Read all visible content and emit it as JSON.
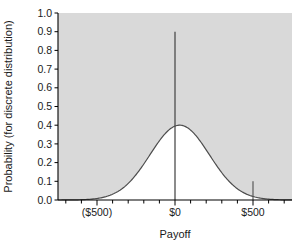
{
  "chart_data": {
    "type": "line",
    "title": "",
    "subtitle": "",
    "xlabel": "Payoff",
    "ylabel": "Probability (for discrete distribution)",
    "xlim": [
      -750,
      750
    ],
    "ylim": [
      0.0,
      1.0
    ],
    "grid": false,
    "legend": null,
    "plot_background": "#d9d9d9",
    "line_color": "#4d4d4d",
    "fill_color": "#ffffff",
    "axis_color": "#000000",
    "x_tick_labels": [
      "($500)",
      "$0",
      "$500"
    ],
    "x_tick_values": [
      -500,
      0,
      500
    ],
    "x_minor_tick_step": 100,
    "y_tick_labels": [
      "0.0",
      "0.1",
      "0.2",
      "0.3",
      "0.4",
      "0.5",
      "0.6",
      "0.7",
      "0.8",
      "0.9",
      "1.0"
    ],
    "y_tick_values": [
      0.0,
      0.1,
      0.2,
      0.3,
      0.4,
      0.5,
      0.6,
      0.7,
      0.8,
      0.9,
      1.0
    ],
    "series": [
      {
        "name": "continuous density",
        "type": "line",
        "kind": "normal-density",
        "mean": 30,
        "stdev": 190,
        "peak_value": 0.4,
        "x": [
          -750,
          -700,
          -650,
          -600,
          -550,
          -500,
          -450,
          -400,
          -350,
          -300,
          -250,
          -200,
          -150,
          -100,
          -50,
          0,
          30,
          50,
          100,
          150,
          200,
          250,
          300,
          350,
          400,
          450,
          500,
          550,
          600,
          650,
          700,
          750
        ],
        "values": [
          0.0,
          0.0,
          0.0,
          0.001,
          0.002,
          0.004,
          0.01,
          0.022,
          0.043,
          0.076,
          0.121,
          0.177,
          0.239,
          0.3,
          0.353,
          0.389,
          0.4,
          0.399,
          0.389,
          0.353,
          0.3,
          0.239,
          0.177,
          0.121,
          0.076,
          0.043,
          0.022,
          0.01,
          0.004,
          0.002,
          0.001,
          0.0
        ]
      },
      {
        "name": "discrete spikes",
        "type": "stem",
        "x": [
          0,
          500
        ],
        "values": [
          0.9,
          0.1
        ]
      }
    ]
  }
}
